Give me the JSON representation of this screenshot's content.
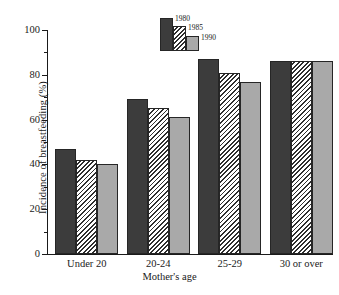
{
  "chart_data": {
    "type": "bar",
    "title": "",
    "xlabel": "Mother's age",
    "ylabel": "Incidence of breastfeeding (%)",
    "categories": [
      "Under 20",
      "20-24",
      "25-29",
      "30 or over"
    ],
    "series": [
      {
        "name": "1980",
        "values": [
          47,
          69,
          87,
          86
        ],
        "fill": "solid-dark",
        "color": "#3c3c3c"
      },
      {
        "name": "1985",
        "values": [
          42,
          65,
          81,
          86
        ],
        "fill": "diagonal-hatch",
        "color": "#ffffff"
      },
      {
        "name": "1990",
        "values": [
          40,
          61,
          77,
          86
        ],
        "fill": "solid-gray",
        "color": "#a9a9a9"
      }
    ],
    "ylim": [
      0,
      100
    ],
    "y_ticks_major": [
      0,
      20,
      40,
      60,
      80,
      100
    ],
    "y_ticks_minor": [
      10,
      30,
      50,
      70,
      90
    ],
    "y_tick_labels": [
      "0",
      "20",
      "40",
      "60",
      "80",
      "100"
    ],
    "grid": false,
    "legend_position": "top-center",
    "legend_entries": [
      "1980",
      "1985",
      "1990"
    ],
    "axis_color": "#1a1a1a",
    "background": "#ffffff"
  }
}
